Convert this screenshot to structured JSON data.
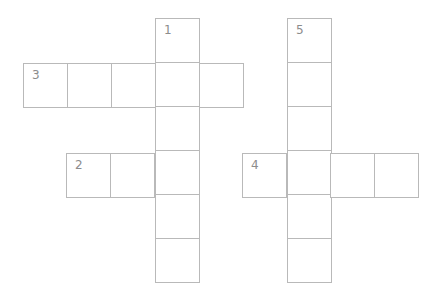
{
  "puzzle": {
    "cell_size": 45,
    "border_color": "#b9b9b9",
    "number_color": "#8c8c8c",
    "words": [
      {
        "number": "1",
        "direction": "down",
        "x": 155,
        "y": 18,
        "length": 6
      },
      {
        "number": "5",
        "direction": "down",
        "x": 287,
        "y": 18,
        "length": 6
      },
      {
        "number": "3",
        "direction": "across",
        "x": 23,
        "y": 63,
        "length": 5
      },
      {
        "number": "2",
        "direction": "across",
        "x": 66,
        "y": 153,
        "length": 3
      },
      {
        "number": "4",
        "direction": "across",
        "x": 242,
        "y": 153,
        "length": 4
      }
    ]
  }
}
